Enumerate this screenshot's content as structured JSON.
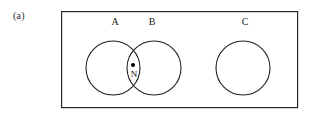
{
  "figure": {
    "panel_label": "(a)",
    "universe_rect": {
      "name": "universal-set-rectangle",
      "x": 61,
      "y": 11,
      "width": 237,
      "height": 97,
      "stroke": "#2a2a2a",
      "stroke_width": 1.2,
      "fill": "none"
    },
    "circles": [
      {
        "label": "A",
        "name": "set-circle-a",
        "cx": 113,
        "cy": 68,
        "r": 27,
        "stroke": "#1f1f1f",
        "stroke_width": 1.1,
        "fill": "none",
        "label_x": 115,
        "label_y": 22
      },
      {
        "label": "B",
        "name": "set-circle-b",
        "cx": 154,
        "cy": 68,
        "r": 27,
        "stroke": "#1f1f1f",
        "stroke_width": 1.1,
        "fill": "none",
        "label_x": 152,
        "label_y": 22
      },
      {
        "label": "C",
        "name": "set-circle-c",
        "cx": 243,
        "cy": 68,
        "r": 27,
        "stroke": "#1f1f1f",
        "stroke_width": 1.1,
        "fill": "none",
        "label_x": 245,
        "label_y": 22
      }
    ],
    "point": {
      "label": "N",
      "name": "point-n",
      "cx": 133,
      "cy": 65,
      "r": 2,
      "fill": "#000000",
      "label_x": 133,
      "label_y": 74
    },
    "background": "#ffffff"
  }
}
